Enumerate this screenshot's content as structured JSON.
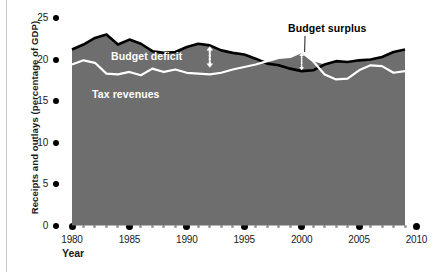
{
  "chart_data": {
    "type": "area",
    "title": "",
    "xlabel": "Year",
    "ylabel": "Receipts and outlays (percentage of GDP)",
    "xlim": [
      1980,
      2010
    ],
    "ylim": [
      0,
      25
    ],
    "ytick_labels": [
      "0",
      "5",
      "10",
      "15",
      "20",
      "25"
    ],
    "ytick_values": [
      0,
      5,
      10,
      15,
      20,
      25
    ],
    "xtick_labels": [
      "1980",
      "1985",
      "1990",
      "1995",
      "2000",
      "2005",
      "2010"
    ],
    "xtick_values": [
      1980,
      1985,
      1990,
      1995,
      2000,
      2005,
      2010
    ],
    "grid": false,
    "legend": "in-plot annotations",
    "x": [
      1980,
      1981,
      1982,
      1983,
      1984,
      1985,
      1986,
      1987,
      1988,
      1989,
      1990,
      1991,
      1992,
      1993,
      1994,
      1995,
      1996,
      1997,
      1998,
      1999,
      2000,
      2001,
      2002,
      2003,
      2004,
      2005,
      2006,
      2007,
      2008,
      2009
    ],
    "series": [
      {
        "name": "Outlays",
        "color": "#000000",
        "values": [
          21.2,
          21.8,
          22.6,
          23.0,
          21.8,
          22.4,
          21.9,
          21.0,
          20.8,
          20.9,
          21.5,
          21.9,
          21.7,
          21.1,
          20.8,
          20.6,
          20.1,
          19.5,
          19.3,
          18.9,
          18.6,
          18.7,
          19.4,
          19.8,
          19.7,
          19.9,
          20.0,
          20.3,
          20.9,
          21.2
        ]
      },
      {
        "name": "Tax revenues",
        "color": "#ffffff",
        "values": [
          19.4,
          19.9,
          19.6,
          18.3,
          18.2,
          18.5,
          18.1,
          18.9,
          18.5,
          18.8,
          18.4,
          18.3,
          18.2,
          18.4,
          18.8,
          19.1,
          19.4,
          19.8,
          20.2,
          20.3,
          20.9,
          19.8,
          18.2,
          17.6,
          17.7,
          18.7,
          19.3,
          19.2,
          18.4,
          18.6
        ]
      }
    ],
    "annotations": [
      {
        "name": "Outlays",
        "label": "Outlays",
        "kind": "series-label",
        "color": "#ffffff"
      },
      {
        "name": "Budget deficit",
        "label": "Budget deficit",
        "kind": "gap-annotation",
        "color": "#ffffff",
        "arrow": "double-headed dotted vertical",
        "at_year": 1992,
        "spans": [
          19.0,
          21.6
        ]
      },
      {
        "name": "Tax revenues",
        "label": "Tax revenues",
        "kind": "series-label",
        "color": "#ffffff"
      },
      {
        "name": "Budget surplus",
        "label": "Budget surplus",
        "kind": "gap-annotation",
        "color": "#000000",
        "arrow": "double-headed dotted vertical with leader line",
        "at_year": 2000,
        "spans": [
          18.7,
          20.8
        ]
      }
    ],
    "area_fill_color": "#6e6e6e",
    "background_color": "#ffffff"
  }
}
